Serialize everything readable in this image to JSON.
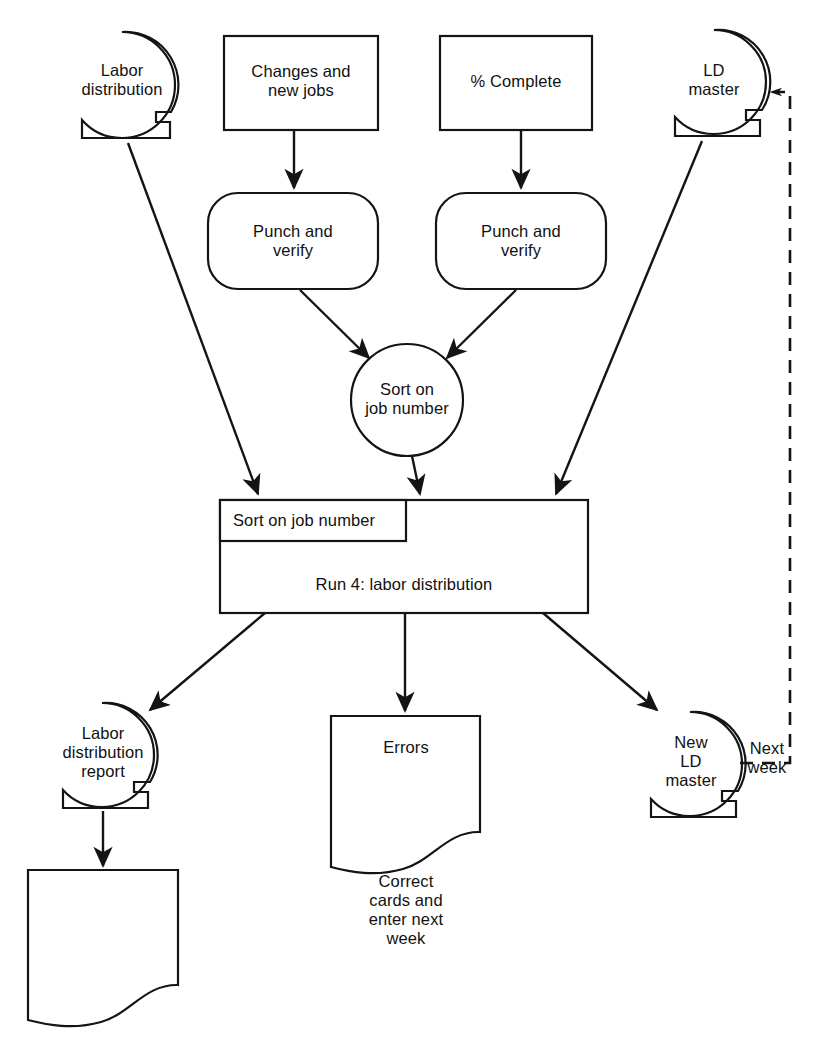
{
  "diagram": {
    "stroke_color": "#141414",
    "fill_color": "#ffffff",
    "text_color": "#111111"
  },
  "nodes": {
    "labor_distribution_tape": {
      "label": "Labor\ndistribution",
      "shape": "magnetic-tape"
    },
    "changes_new_jobs": {
      "label": "Changes and\nnew jobs",
      "shape": "rectangle"
    },
    "percent_complete": {
      "label": "% Complete",
      "shape": "rectangle"
    },
    "ld_master_tape": {
      "label": "LD\nmaster",
      "shape": "magnetic-tape"
    },
    "punch_verify_left": {
      "label": "Punch and\nverify",
      "shape": "rounded-rectangle"
    },
    "punch_verify_right": {
      "label": "Punch and\nverify",
      "shape": "rounded-rectangle"
    },
    "sort_circle": {
      "label": "Sort on\njob number",
      "shape": "circle"
    },
    "sort_inner_box": {
      "label": "Sort on job number",
      "shape": "rectangle"
    },
    "run4_box": {
      "label": "Run 4: labor distribution",
      "shape": "rectangle"
    },
    "labor_distribution_report": {
      "label": "Labor\ndistribution\nreport",
      "shape": "magnetic-tape"
    },
    "errors_document": {
      "label": "Errors",
      "shape": "document"
    },
    "errors_caption": {
      "label": "Correct\ncards and\nenter next\nweek"
    },
    "new_ld_master": {
      "label": "New\nLD\nmaster",
      "shape": "magnetic-tape"
    },
    "report_document": {
      "label": "",
      "shape": "document"
    }
  },
  "edges": {
    "next_week_label": "Next\nweek"
  }
}
